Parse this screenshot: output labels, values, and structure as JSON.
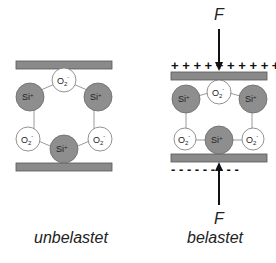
{
  "panels": [
    {
      "id": "unloaded",
      "caption": "unbelastet",
      "top_charges": "",
      "bottom_charges": "",
      "force_label": ""
    },
    {
      "id": "loaded",
      "caption": "belastet",
      "top_charges": "+ + + + + + + + + +",
      "bottom_charges": "- - - - - - - - -",
      "force_label_top": "F",
      "force_label_bottom": "F"
    }
  ],
  "atoms": {
    "silicon_label": "Si",
    "silicon_charge": "+",
    "oxygen_label": "O",
    "oxygen_subscript": "2",
    "oxygen_charge": "-"
  },
  "colors": {
    "plate": "#8a8a8a",
    "silicon": "#8e8e8e",
    "oxygen": "#ffffff",
    "bond": "#9a9a9a"
  }
}
